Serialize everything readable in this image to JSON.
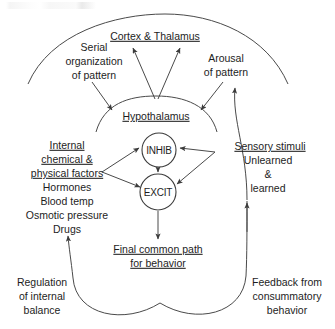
{
  "figure": {
    "type": "flow-diagram",
    "line_color": "#4a4a4a",
    "text_color": "#1d1d1d",
    "background": "#ffffff"
  },
  "labels": {
    "cortex_thalamus": "Cortex & Thalamus",
    "serial_organization": [
      "Serial",
      "organization",
      "of pattern"
    ],
    "arousal": [
      "Arousal",
      "of pattern"
    ],
    "hypothalamus": "Hypothalamus",
    "inhib": "INHIB",
    "excit": "EXCIT",
    "internal_factors_heading": [
      "Internal",
      "chemical &",
      "physical factors"
    ],
    "internal_factors_items": [
      "Hormones",
      "Blood temp",
      "Osmotic pressure",
      "Drugs"
    ],
    "sensory_heading": "Sensory stimuli",
    "sensory_items": [
      "Unlearned",
      "&",
      "learned"
    ],
    "final_path": [
      "Final common path",
      "for behavior"
    ],
    "regulation": [
      "Regulation",
      "of internal",
      "balance"
    ],
    "feedback": [
      "Feedback from",
      "consummatory",
      "behavior"
    ]
  },
  "underlined": {
    "cortex_thalamus": true,
    "hypothalamus": true,
    "internal_factors_heading": true,
    "sensory_heading": true,
    "final_path": true
  }
}
